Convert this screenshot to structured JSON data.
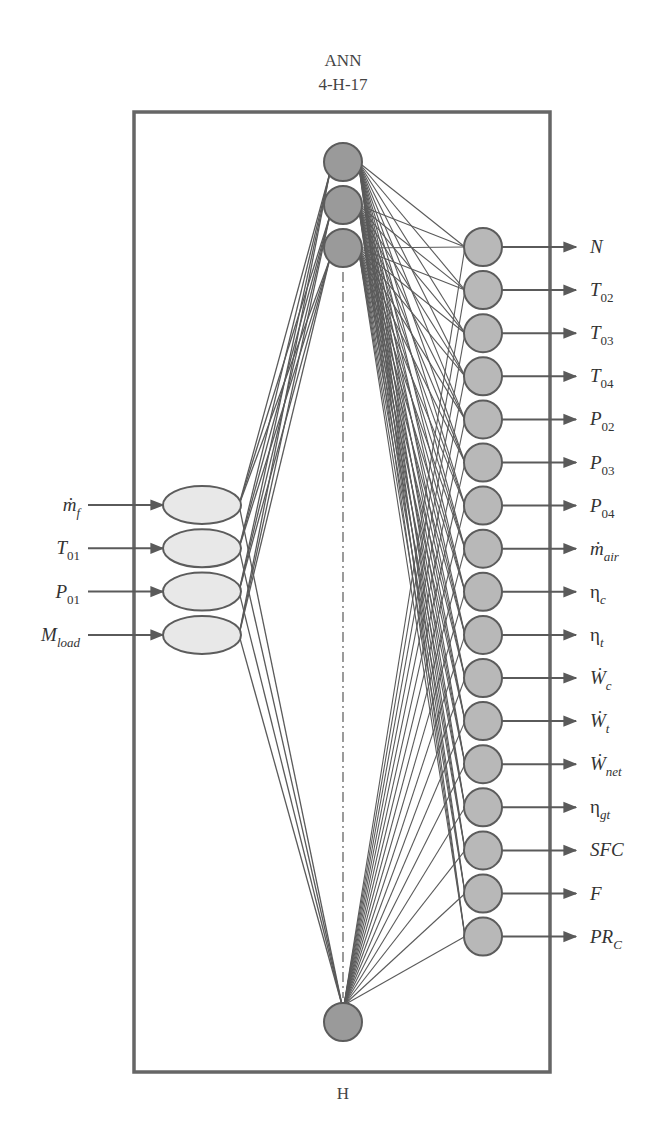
{
  "title": {
    "line1": "ANN",
    "line2": "4-H-17"
  },
  "hidden_layer_label": "H",
  "colors": {
    "frame": "#666666",
    "edge": "#5a5a5a",
    "input_fill": "#e8e8e8",
    "hidden_fill": "#9a9a9a",
    "output_fill": "#b8b8b8",
    "node_stroke": "#5c5c5c"
  },
  "inputs": [
    {
      "base": "ṁ",
      "sub": "f"
    },
    {
      "base": "T",
      "sub": "01"
    },
    {
      "base": "P",
      "sub": "01"
    },
    {
      "base": "M",
      "sub": "load"
    }
  ],
  "hidden": {
    "count_label": "H",
    "visible_top_nodes": 3,
    "visible_bottom_nodes": 1
  },
  "outputs": [
    {
      "base": "N",
      "sub": ""
    },
    {
      "base": "T",
      "sub": "02"
    },
    {
      "base": "T",
      "sub": "03"
    },
    {
      "base": "T",
      "sub": "04"
    },
    {
      "base": "P",
      "sub": "02"
    },
    {
      "base": "P",
      "sub": "03"
    },
    {
      "base": "P",
      "sub": "04"
    },
    {
      "base": "ṁ",
      "sub": "air"
    },
    {
      "base": "η",
      "sub": "c",
      "upright": true
    },
    {
      "base": "η",
      "sub": "t",
      "upright": true
    },
    {
      "base": "Ẇ",
      "sub": "c"
    },
    {
      "base": "Ẇ",
      "sub": "t"
    },
    {
      "base": "Ẇ",
      "sub": "net"
    },
    {
      "base": "η",
      "sub": "gt",
      "upright": true
    },
    {
      "base": "SFC",
      "sub": ""
    },
    {
      "base": "F",
      "sub": ""
    },
    {
      "base": "PR",
      "sub": "C"
    }
  ]
}
